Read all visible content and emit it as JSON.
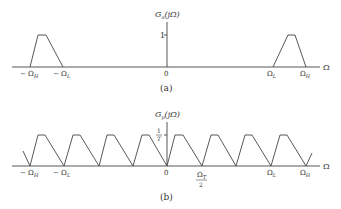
{
  "panel_a": {
    "ylabel_main": "G",
    "ylabel_sub": "a",
    "ylabel_arg": "(jΩ)",
    "ytick": "1",
    "origin": "0",
    "xaxis_label": "Ω",
    "x_ticks": {
      "neg_high": "− Ω",
      "neg_high_sub": "H",
      "neg_low": "− Ω",
      "neg_low_sub": "L",
      "pos_low": "Ω",
      "pos_low_sub": "L",
      "pos_high": "Ω",
      "pos_high_sub": "H"
    },
    "caption": "(a)"
  },
  "panel_b": {
    "ylabel_main": "G",
    "ylabel_sub": "p",
    "ylabel_arg": "(jΩ)",
    "ytick_num": "1",
    "ytick_den": "T",
    "origin": "0",
    "xaxis_label": "Ω",
    "x_ticks": {
      "neg_high": "− Ω",
      "neg_high_sub": "H",
      "neg_low": "− Ω",
      "neg_low_sub": "L",
      "half_t_num": "Ω",
      "half_t_num_sub": "T",
      "half_t_den": "2",
      "pos_low": "Ω",
      "pos_low_sub": "L",
      "pos_high": "Ω",
      "pos_high_sub": "H"
    },
    "caption": "(b)"
  },
  "colors": {
    "line": "#444444",
    "text": "#333333"
  }
}
